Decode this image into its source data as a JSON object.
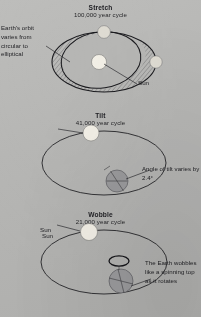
{
  "figure": {
    "background_color": "#b8b8b6",
    "ink_color": "#1b1b1f",
    "sun_color": "#f2efe6",
    "earth_color": "#9a9a9c"
  },
  "sections": [
    {
      "id": "stretch",
      "title": "Stretch",
      "subtitle": "100,000 year cycle",
      "callout": "Earth's orbit varies from circular to elliptical",
      "sun_label": "Sun"
    },
    {
      "id": "tilt",
      "title": "Tilt",
      "subtitle": "41,000 year cycle",
      "callout": "Angle of tilt varies by 2.4°",
      "sun_label": "Sun"
    },
    {
      "id": "wobble",
      "title": "Wobble",
      "subtitle": "21,000 year cycle",
      "callout": "The Earth wobbles like a spinning top as it rotates",
      "sun_label": "Sun"
    }
  ]
}
